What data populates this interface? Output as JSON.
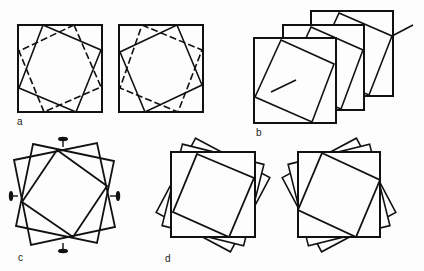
{
  "figure": {
    "background": "#fdfdfd",
    "stroke": "#111111",
    "panels": [
      {
        "id": "a",
        "label": "a",
        "label_pos": [
          17,
          117
        ],
        "description": "Two squares each with inscribed solid and dashed rotated squares (mirror images)"
      },
      {
        "id": "b",
        "label": "b",
        "label_pos": [
          256,
          128
        ],
        "description": "Three stacked squares with inscribed rotated square and rotation axis line"
      },
      {
        "id": "c",
        "label": "c",
        "label_pos": [
          18,
          253
        ],
        "description": "Two oppositely tilted squares with inscribed square and four two-fold axis symbols"
      },
      {
        "id": "d",
        "label": "d",
        "label_pos": [
          165,
          254
        ],
        "description": "Two stacks of progressively rotated squares (clockwise and counter-clockwise)"
      }
    ]
  },
  "shapes": {
    "a_left_outer": [
      [
        18,
        25
      ],
      [
        102,
        25
      ],
      [
        102,
        112
      ],
      [
        18,
        112
      ]
    ],
    "a_left_solid": [
      [
        43,
        25
      ],
      [
        101,
        50
      ],
      [
        76,
        112
      ],
      [
        19,
        88
      ]
    ],
    "a_left_dashed": [
      [
        74,
        25
      ],
      [
        101,
        87
      ],
      [
        44,
        112
      ],
      [
        19,
        51
      ]
    ],
    "a_right_outer": [
      [
        119,
        25
      ],
      [
        203,
        25
      ],
      [
        203,
        112
      ],
      [
        119,
        112
      ]
    ],
    "a_right_solid": [
      [
        177,
        25
      ],
      [
        202,
        85
      ],
      [
        145,
        112
      ],
      [
        120,
        52
      ]
    ],
    "a_right_dashed": [
      [
        142,
        25
      ],
      [
        202,
        50
      ],
      [
        178,
        112
      ],
      [
        120,
        88
      ]
    ],
    "b_back": [
      [
        311,
        11
      ],
      [
        393,
        11
      ],
      [
        393,
        96
      ],
      [
        311,
        96
      ]
    ],
    "b_back_inner": [
      [
        339,
        13
      ],
      [
        392,
        36
      ],
      [
        369,
        95
      ],
      [
        312,
        72
      ]
    ],
    "b_mid": [
      [
        283,
        25
      ],
      [
        364,
        25
      ],
      [
        364,
        110
      ],
      [
        283,
        110
      ]
    ],
    "b_mid_inner": [
      [
        311,
        27
      ],
      [
        363,
        50
      ],
      [
        341,
        109
      ],
      [
        284,
        86
      ]
    ],
    "b_front": [
      [
        254,
        38
      ],
      [
        336,
        38
      ],
      [
        336,
        123
      ],
      [
        254,
        123
      ]
    ],
    "b_front_inner": [
      [
        281,
        40
      ],
      [
        334,
        64
      ],
      [
        312,
        122
      ],
      [
        255,
        97
      ]
    ],
    "b_axis_front": [
      [
        271,
        92
      ],
      [
        296,
        80
      ]
    ],
    "b_axis_back": [
      [
        392,
        36
      ],
      [
        413,
        25
      ]
    ],
    "c_sq1": [
      [
        33,
        144
      ],
      [
        114,
        161
      ],
      [
        97,
        243
      ],
      [
        16,
        226
      ]
    ],
    "c_sq2": [
      [
        14,
        160
      ],
      [
        97,
        143
      ],
      [
        115,
        227
      ],
      [
        31,
        245
      ]
    ],
    "c_inner": [
      [
        57,
        150
      ],
      [
        107,
        186
      ],
      [
        73,
        237
      ],
      [
        22,
        202
      ]
    ],
    "c_axes": [
      {
        "stem": [
          [
            63,
            140
          ],
          [
            63,
            147
          ]
        ],
        "ellipse": [
          63,
          139,
          5,
          2.2
        ],
        "dir": "h"
      },
      {
        "stem": [
          [
            110,
            196
          ],
          [
            117,
            196
          ]
        ],
        "ellipse": [
          118,
          196,
          2.2,
          5
        ],
        "dir": "v"
      },
      {
        "stem": [
          [
            63,
            243
          ],
          [
            63,
            250
          ]
        ],
        "ellipse": [
          63,
          251,
          5,
          2.2
        ],
        "dir": "h"
      },
      {
        "stem": [
          [
            11,
            196
          ],
          [
            18,
            196
          ]
        ],
        "ellipse": [
          11,
          196,
          2.2,
          5
        ],
        "dir": "v"
      }
    ],
    "d_left_back2": {
      "center": [
        213,
        195
      ],
      "size": 84,
      "angle": 28
    },
    "d_left_back1": {
      "center": [
        213,
        195
      ],
      "size": 84,
      "angle": 14
    },
    "d_left_main": [
      [
        171,
        152
      ],
      [
        255,
        152
      ],
      [
        255,
        237
      ],
      [
        171,
        237
      ]
    ],
    "d_left_inner": [
      [
        197,
        154
      ],
      [
        254,
        178
      ],
      [
        229,
        237
      ],
      [
        173,
        212
      ]
    ],
    "d_right_back2": {
      "center": [
        339,
        195
      ],
      "size": 84,
      "angle": -28
    },
    "d_right_back1": {
      "center": [
        339,
        195
      ],
      "size": 84,
      "angle": -14
    },
    "d_right_main": [
      [
        298,
        152
      ],
      [
        380,
        152
      ],
      [
        380,
        237
      ],
      [
        298,
        237
      ]
    ],
    "d_right_inner": [
      [
        322,
        153
      ],
      [
        380,
        180
      ],
      [
        356,
        237
      ],
      [
        298,
        210
      ]
    ]
  }
}
